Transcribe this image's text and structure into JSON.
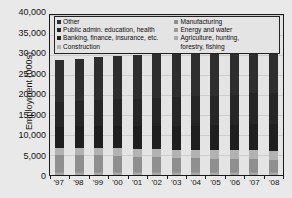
{
  "chart_data": {
    "type": "bar",
    "subtype": "stacked-column",
    "title": "",
    "xlabel": "",
    "ylabel": "Employment (000s)",
    "ylim": [
      0,
      40000
    ],
    "ytick_step": 5000,
    "ytick_labels": [
      "40,000",
      "35,000",
      "30,000",
      "25,000",
      "20,000",
      "15,000",
      "10,000",
      "5,000",
      "0"
    ],
    "ytick_values": [
      40000,
      35000,
      30000,
      25000,
      20000,
      15000,
      10000,
      5000,
      0
    ],
    "grid": true,
    "legend_position": "top-inside",
    "categories": [
      "'97",
      "'98",
      "'99",
      "'00",
      "'01",
      "'02",
      "'03",
      "'04",
      "'05",
      "'06",
      "'07",
      "'08"
    ],
    "series": [
      {
        "name": "Agriculture, hunting, forestry, fishing",
        "color": "#a8a8a8",
        "values": [
          560,
          555,
          550,
          545,
          540,
          535,
          530,
          525,
          520,
          515,
          510,
          505
        ]
      },
      {
        "name": "Energy and water",
        "color": "#9a9a9a",
        "values": [
          300,
          295,
          290,
          285,
          280,
          275,
          275,
          272,
          270,
          268,
          266,
          265
        ]
      },
      {
        "name": "Manufacturing",
        "color": "#8f8f8f",
        "values": [
          4200,
          4150,
          4050,
          3950,
          3800,
          3650,
          3500,
          3400,
          3300,
          3200,
          3150,
          3100
        ]
      },
      {
        "name": "Construction",
        "color": "#b2b2b2",
        "values": [
          1800,
          1850,
          1900,
          1930,
          1950,
          1980,
          2020,
          2080,
          2120,
          2180,
          2220,
          2230
        ]
      },
      {
        "name": "Banking, finance, insurance, etc.",
        "color": "#1f1f1f",
        "values": [
          5100,
          5300,
          5450,
          5600,
          5700,
          5800,
          5900,
          6050,
          6200,
          6400,
          6600,
          6700
        ]
      },
      {
        "name": "Public admin. education, health",
        "color": "#262626",
        "values": [
          6200,
          6300,
          6450,
          6600,
          6800,
          7000,
          7200,
          7350,
          7450,
          7550,
          7650,
          7750
        ]
      },
      {
        "name": "Other",
        "color": "#2e2e2e",
        "values": [
          10540,
          10650,
          10760,
          10890,
          11030,
          11130,
          11195,
          11273,
          11390,
          11447,
          11534,
          11590
        ]
      }
    ],
    "totals": [
      28700,
      29100,
      29450,
      29800,
      30100,
      30370,
      30620,
      30950,
      31250,
      31560,
      31930,
      32140
    ]
  },
  "legend": {
    "left_column": [
      "Other",
      "Public admin. education, health",
      "Banking, finance, insurance, etc.",
      "Construction"
    ],
    "right_column": [
      "Manufacturing",
      "Energy and water",
      "Agriculture, hunting,\nforestry, fishing"
    ]
  },
  "colors": {
    "plot_background": "#e4e4e4",
    "page_background": "#e9e9e9",
    "axis": "#1a1a1a",
    "gridline": "#cdcdcd",
    "text": "#141414"
  }
}
